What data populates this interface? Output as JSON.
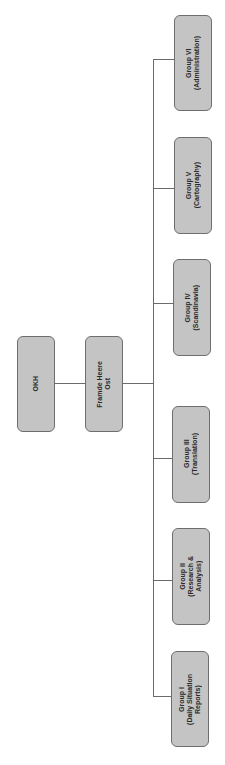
{
  "diagram": {
    "type": "org-chart",
    "orientation": "rotated-90-ccw",
    "colors": {
      "box_fill": "#c4c4c4",
      "box_border": "#6e6e6e",
      "connector": "#6a6a6a",
      "text": "#2a2a2a"
    },
    "root": {
      "label": "OKH"
    },
    "sub": {
      "label": "Framde Heere\nOst"
    },
    "groups": [
      {
        "label": "Group I\n(Daily Situation\nReports)"
      },
      {
        "label": "Group II\n(Research &\nAnalysis)"
      },
      {
        "label": "Group III\n(Translation)"
      },
      {
        "label": "Group IV\n(Scandinavia)"
      },
      {
        "label": "Group V\n(Cartography)"
      },
      {
        "label": "Group VI\n(Administration)"
      }
    ]
  }
}
